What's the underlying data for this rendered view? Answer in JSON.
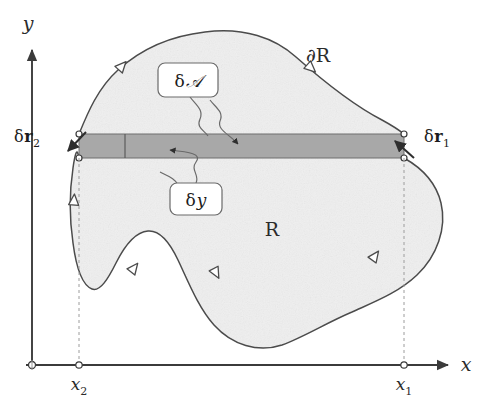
{
  "figure": {
    "background_color": "#ffffff",
    "ink_color": "#3a3a3a",
    "region_fill_color": "#efefef",
    "strip_fill_color": "#a8a8a8",
    "axis_color": "#4a4a4a"
  },
  "axes": {
    "x_axis_label": "x",
    "y_axis_label": "y",
    "origin_marker": "open-circle",
    "ticks": [
      {
        "id": "x2",
        "label_base": "x",
        "label_sub": "2",
        "x_px": 79
      },
      {
        "id": "x1",
        "label_base": "x",
        "label_sub": "1",
        "x_px": 404
      }
    ]
  },
  "region": {
    "interior_label": "R",
    "boundary_label_base": "∂",
    "boundary_label_name": "R",
    "boundary_label": "∂R",
    "orientation": "counterclockwise",
    "arrow_count": 6
  },
  "strip": {
    "description": "horizontal area element of thickness delta-y",
    "fill_color": "#a8a8a8",
    "left_x_px": 79,
    "right_x_px": 404,
    "top_y_px": 134,
    "bottom_y_px": 158,
    "divider_x_px": 125
  },
  "callouts": [
    {
      "id": "delta-area",
      "label_delta": "δ",
      "label_symbol": "𝒜",
      "label": "δ𝒜",
      "box_x": 158,
      "box_y": 63,
      "box_w": 60,
      "box_h": 34
    },
    {
      "id": "delta-y",
      "label_delta": "δ",
      "label_symbol": "y",
      "label": "δy",
      "box_x": 170,
      "box_y": 183,
      "box_w": 52,
      "box_h": 32
    }
  ],
  "vectors": [
    {
      "id": "delta-r1",
      "label_delta": "δ",
      "label_bold": "r",
      "label_sub": "1",
      "label": "δr₁",
      "text_x": 404,
      "text_y": 138,
      "anchor_x_px": 404,
      "anchor_y_px": 146,
      "direction": "up-left"
    },
    {
      "id": "delta-r2",
      "label_delta": "δ",
      "label_bold": "r",
      "label_sub": "2",
      "label": "δr₂",
      "text_x": 40,
      "text_y": 138,
      "anchor_x_px": 79,
      "anchor_y_px": 146,
      "direction": "down-left"
    }
  ]
}
